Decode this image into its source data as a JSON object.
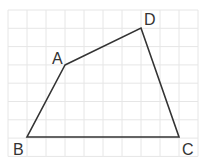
{
  "diagram": {
    "type": "quadrilateral-on-grid",
    "grid": {
      "x0": 8,
      "y0": 10,
      "step_x": 19,
      "step_y": 18.3,
      "cols": 10,
      "rows": 8,
      "color": "#e6e6e6"
    },
    "points": [
      {
        "label": "A",
        "x": 65,
        "y": 65,
        "lx": 52,
        "ly": 64
      },
      {
        "label": "B",
        "x": 27,
        "y": 137,
        "lx": 13,
        "ly": 155
      },
      {
        "label": "C",
        "x": 179,
        "y": 137,
        "lx": 182,
        "ly": 155
      },
      {
        "label": "D",
        "x": 141,
        "y": 28,
        "lx": 144,
        "ly": 25
      }
    ],
    "edges": [
      [
        "A",
        "D"
      ],
      [
        "D",
        "C"
      ],
      [
        "C",
        "B"
      ],
      [
        "B",
        "A"
      ]
    ],
    "line_color": "#333333"
  }
}
